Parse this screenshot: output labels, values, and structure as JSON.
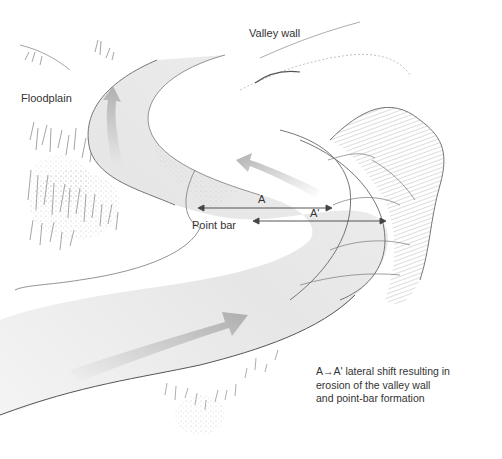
{
  "diagram": {
    "labels": {
      "valley_wall": "Valley wall",
      "floodplain": "Floodplain",
      "point_bar": "Point bar",
      "a": "A",
      "a_prime": "A'"
    },
    "caption": {
      "line1": "A→A' lateral shift resulting in",
      "line2": "erosion of the valley wall",
      "line3": "and point-bar formation"
    },
    "arrows": [
      {
        "id": "flow-upper-left",
        "direction": "up"
      },
      {
        "id": "flow-middle",
        "direction": "up-left"
      },
      {
        "id": "flow-lower",
        "direction": "right"
      }
    ],
    "measurements": [
      {
        "label": "A",
        "from_x": 198,
        "to_x": 332,
        "y": 208
      },
      {
        "label": "A'",
        "from_x": 253,
        "to_x": 386,
        "y": 221
      }
    ],
    "colors": {
      "water_light": "#ececec",
      "water_mid": "#d9d9d9",
      "arrow": "#b5b5b5",
      "line": "#555555",
      "text": "#333333"
    }
  }
}
